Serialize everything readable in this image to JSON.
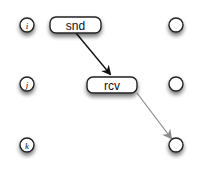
{
  "diagram": {
    "type": "message-sequence",
    "processes": [
      {
        "id": "i",
        "label": "i"
      },
      {
        "id": "j",
        "label": "j"
      },
      {
        "id": "k",
        "label": "k"
      }
    ],
    "events": [
      {
        "id": "snd",
        "label": "snd",
        "process": "i"
      },
      {
        "id": "rcv",
        "label": "rcv",
        "process": "j"
      }
    ],
    "edges": [
      {
        "from": "snd",
        "to": "rcv",
        "color": "#111111"
      },
      {
        "from": "rcv",
        "to": "k-end",
        "color": "#8a8a8a"
      }
    ]
  },
  "colors": {
    "stroke": "#222222",
    "arrow_dark": "#111111",
    "arrow_light": "#8a8a8a",
    "shadow": "#9a9a9a",
    "fill": "#ffffff"
  }
}
